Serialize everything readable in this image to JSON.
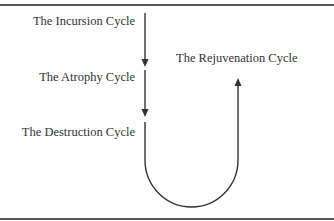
{
  "diagram": {
    "labels": {
      "incursion": "The Incursion Cycle",
      "atrophy": "The Atrophy Cycle",
      "destruction": "The Destruction Cycle",
      "rejuvenation": "The Rejuvenation Cycle"
    },
    "colors": {
      "line": "#333333",
      "rule": "#5a5a5a"
    }
  }
}
